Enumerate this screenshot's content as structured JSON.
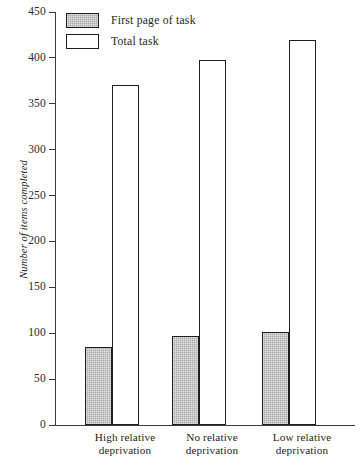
{
  "chart_data": {
    "type": "bar",
    "title": "",
    "xlabel": "",
    "ylabel": "Number of items completed",
    "ylim": [
      0,
      450
    ],
    "yticks": [
      0,
      50,
      100,
      150,
      200,
      250,
      300,
      350,
      400,
      450
    ],
    "grid": false,
    "legend_position": "top-left",
    "categories": [
      "High relative deprivation",
      "No relative deprivation",
      "Low relative deprivation"
    ],
    "category_lines": [
      [
        "High relative",
        "deprivation"
      ],
      [
        "No relative",
        "deprivation"
      ],
      [
        "Low relative",
        "deprivation"
      ]
    ],
    "series": [
      {
        "name": "First page of task",
        "style": "shaded",
        "color": "#a9a9a9",
        "values": [
          85,
          97,
          101
        ]
      },
      {
        "name": "Total task",
        "style": "hollow",
        "color": "#ffffff",
        "values": [
          371,
          398,
          420
        ]
      }
    ]
  },
  "axis": {
    "tick_labels": [
      "450",
      "400",
      "350",
      "300",
      "250",
      "200",
      "150",
      "100",
      "50",
      "0"
    ],
    "y_title": "Number of items completed"
  },
  "legend": {
    "entries": [
      {
        "label": "First page of task",
        "style": "shaded"
      },
      {
        "label": "Total task",
        "style": "hollow"
      }
    ]
  },
  "categories": {
    "items": [
      {
        "line1": "High relative",
        "line2": "deprivation"
      },
      {
        "line1": "No relative",
        "line2": "deprivation"
      },
      {
        "line1": "Low relative",
        "line2": "deprivation"
      }
    ]
  }
}
